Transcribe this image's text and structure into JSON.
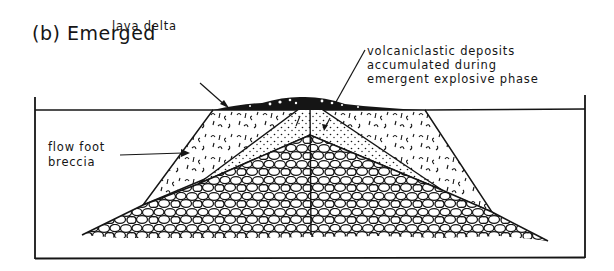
{
  "figure": {
    "title": "(b) Emerged",
    "labels": {
      "lava_delta": "lava delta",
      "volcaniclastic_line1": "volcaniclastic deposits",
      "volcaniclastic_line2": "accumulated during",
      "volcaniclastic_line3": "emergent explosive phase",
      "flow_foot_line1": "flow foot",
      "flow_foot_line2": "breccia"
    },
    "colors": {
      "ink": "#151515",
      "background": "#ffffff"
    }
  }
}
